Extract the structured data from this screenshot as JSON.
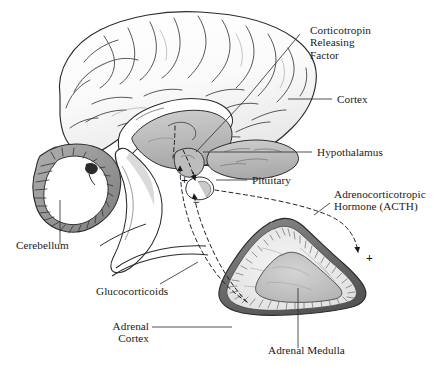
{
  "figure": {
    "width": 443,
    "height": 374,
    "background": "#ffffff",
    "ink": "#1a1a1a"
  },
  "labels": {
    "crf": "Corticotropin\nReleasing\nFactor",
    "cortex": "Cortex",
    "hypothalamus": "Hypothalamus",
    "pituitary": "Pituitary",
    "acth": "Adrenocorticotropic\nHormone (ACTH)",
    "cerebellum": "Cerebellum",
    "glucocorticoids": "Glucocorticoids",
    "adrenal_cortex": "Adrenal\nCortex",
    "adrenal_medulla": "Adrenal Medulla"
  },
  "signs": {
    "plus_pituitary": "+",
    "minus_hypothalamus": "−",
    "plus_adrenal": "+"
  },
  "colors": {
    "outline": "#2b2b2b",
    "cortex_fill": "#fbfbfb",
    "deep_structure_fill": "#b9b9b9",
    "brainstem_fill": "#ffffff",
    "cerebellum_fill": "#9a9a9a",
    "adrenal_capsule": "#6f6f6f",
    "adrenal_cortex_fill": "#ededed",
    "adrenal_medulla_fill": "#c2c2c2",
    "leader_line": "#333333",
    "dashed_line": "#1f1f1f"
  }
}
